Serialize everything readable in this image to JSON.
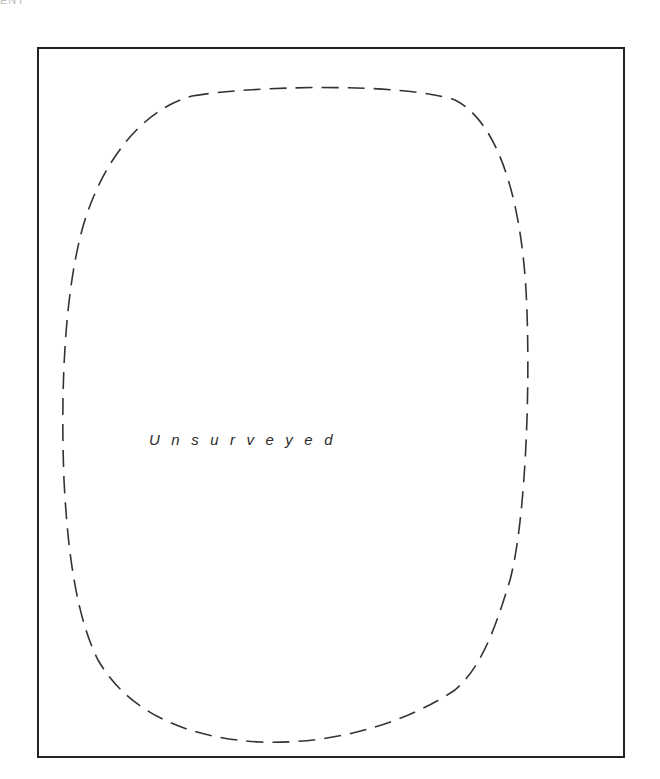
{
  "diagram": {
    "corner_label": "ENT",
    "frame": {
      "stroke_color": "#222222"
    },
    "boundary": {
      "style": "dashed",
      "stroke_color": "#333333"
    },
    "area_label": "Unsurveyed"
  }
}
